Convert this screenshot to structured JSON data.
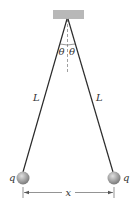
{
  "diagram": {
    "labels": {
      "length_left": "L",
      "length_right": "L",
      "angle_left": "θ",
      "angle_right": "θ",
      "charge_left": "q",
      "charge_right": "q",
      "separation": "x"
    },
    "elements": {
      "support": "ceiling-block",
      "strings": 2,
      "spheres": 2,
      "vertical_reference": "dashed-line"
    },
    "colors": {
      "support": "#b8b8b8",
      "string": "#2a2a2a",
      "sphere_light": "#d8d8d8",
      "sphere_dark": "#7a7a7a",
      "text": "#333333"
    }
  }
}
